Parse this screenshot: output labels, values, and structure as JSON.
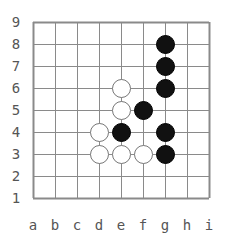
{
  "board": {
    "size": 9,
    "columns": [
      "a",
      "b",
      "c",
      "d",
      "e",
      "f",
      "g",
      "h",
      "i"
    ],
    "rows": [
      "1",
      "2",
      "3",
      "4",
      "5",
      "6",
      "7",
      "8",
      "9"
    ],
    "line_color": "#8a8a8a",
    "black_color": "#111111",
    "white_color": "#ffffff"
  },
  "stones": {
    "black": [
      "g8",
      "g7",
      "g6",
      "f5",
      "e4",
      "g4",
      "g3"
    ],
    "white": [
      "e6",
      "e5",
      "d4",
      "d3",
      "e3",
      "f3"
    ]
  }
}
